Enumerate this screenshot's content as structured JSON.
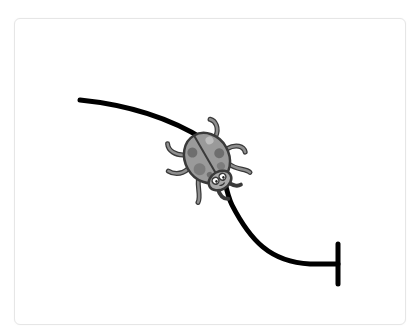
{
  "stage": {
    "label": "Ladybug path puzzle"
  },
  "path": {
    "description": "Black curved track from upper-left to lower-right ending at a vertical stop bar",
    "color": "#000000",
    "start": {
      "x": 80,
      "y": 100
    },
    "end": {
      "x": 338,
      "y": 264
    }
  },
  "character": {
    "name": "ladybug",
    "description": "Gray spotted ladybug walking down the track",
    "body_color": "#9a9a9a",
    "spot_color": "#6e6e6e",
    "outline_color": "#3a3a3a"
  },
  "goal": {
    "name": "end-bar",
    "description": "Vertical stop bar at end of track"
  }
}
